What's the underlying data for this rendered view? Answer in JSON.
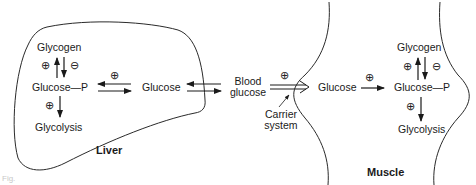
{
  "liver": {
    "title": "Liver",
    "glycogen": "Glycogen",
    "glucose_p": "Glucose—P",
    "glycolysis": "Glycolysis",
    "glucose": "Glucose",
    "sym_glycogen_up": "⊕",
    "sym_glycogen_down": "⊖",
    "sym_glycolysis": "⊕",
    "sym_glucose_to_glucosep": "⊕"
  },
  "blood": {
    "label_line1": "Blood",
    "label_line2": "glucose",
    "sym_uptake": "⊕",
    "carrier_line1": "Carrier",
    "carrier_line2": "system"
  },
  "muscle": {
    "title": "Muscle",
    "glucose": "Glucose",
    "glycogen": "Glycogen",
    "glucose_p": "Glucose—P",
    "glycolysis": "Glycolysis",
    "sym_phosphorylation": "⊕",
    "sym_glycogen_up": "⊕",
    "sym_glycogen_down": "⊖",
    "sym_glycolysis": "⊕"
  },
  "caption": "Fig."
}
